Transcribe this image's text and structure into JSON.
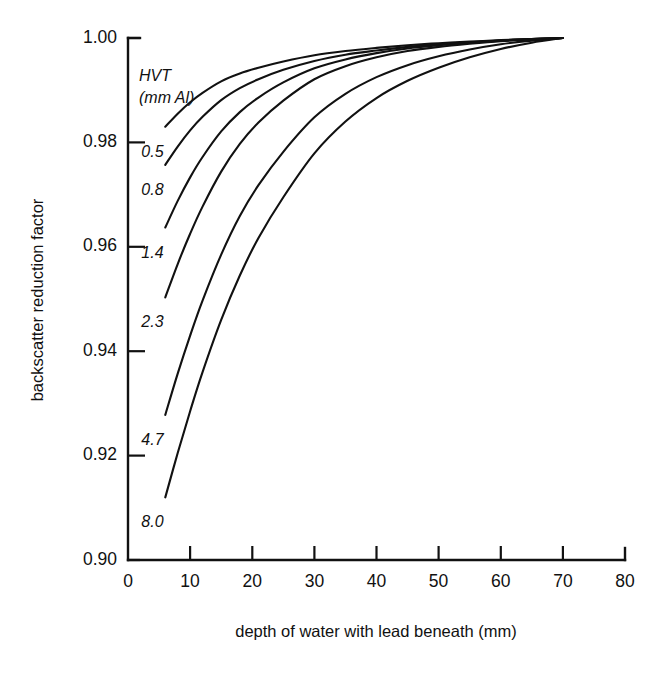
{
  "chart_data": {
    "type": "line",
    "title": "",
    "xlabel": "depth of water with lead beneath (mm)",
    "ylabel": "backscatter reduction factor",
    "xlim": [
      0,
      80
    ],
    "ylim": [
      0.9,
      1.0
    ],
    "xticks": [
      0,
      10,
      20,
      30,
      40,
      50,
      60,
      70,
      80
    ],
    "xtick_labels": [
      "0",
      "10",
      "20",
      "30",
      "40",
      "50",
      "60",
      "70",
      "80"
    ],
    "yticks": [
      0.9,
      0.92,
      0.94,
      0.96,
      0.98,
      1.0
    ],
    "ytick_labels": [
      "0.90",
      "0.92",
      "0.94",
      "0.96",
      "0.98",
      "1.00"
    ],
    "grid": false,
    "legend_position": "inside-upper-left (inline curve labels)",
    "legend_title": "HVT",
    "legend_units": "(mm Al)",
    "series": [
      {
        "name": "0.5",
        "label": "0.5",
        "x": [
          6,
          8,
          10,
          12,
          15,
          18,
          21,
          25,
          30,
          35,
          40,
          45,
          50,
          55,
          60,
          65,
          70
        ],
        "values": [
          0.983,
          0.9855,
          0.9877,
          0.9895,
          0.9917,
          0.9932,
          0.9943,
          0.9955,
          0.9967,
          0.9975,
          0.9981,
          0.9986,
          0.999,
          0.9993,
          0.9996,
          0.9998,
          1.0
        ]
      },
      {
        "name": "0.8",
        "label": "0.8",
        "x": [
          6,
          8,
          10,
          12,
          15,
          18,
          21,
          25,
          30,
          35,
          40,
          45,
          50,
          55,
          60,
          65,
          70
        ],
        "values": [
          0.9757,
          0.9792,
          0.9823,
          0.9849,
          0.9881,
          0.9904,
          0.9921,
          0.9939,
          0.9956,
          0.9968,
          0.9976,
          0.9983,
          0.9988,
          0.9992,
          0.9995,
          0.9998,
          1.0
        ]
      },
      {
        "name": "1.4",
        "label": "1.4",
        "x": [
          6,
          8,
          10,
          12,
          15,
          18,
          21,
          25,
          30,
          35,
          40,
          45,
          50,
          55,
          60,
          65,
          70
        ],
        "values": [
          0.9637,
          0.9688,
          0.9733,
          0.9772,
          0.9821,
          0.9858,
          0.9886,
          0.9915,
          0.9942,
          0.9959,
          0.9971,
          0.998,
          0.9986,
          0.9991,
          0.9995,
          0.9998,
          1.0
        ]
      },
      {
        "name": "2.3",
        "label": "2.3",
        "x": [
          6,
          8,
          10,
          12,
          15,
          18,
          21,
          25,
          30,
          35,
          40,
          45,
          50,
          55,
          60,
          65,
          70
        ],
        "values": [
          0.9503,
          0.9567,
          0.9625,
          0.9677,
          0.9744,
          0.9797,
          0.9838,
          0.988,
          0.9921,
          0.9946,
          0.9963,
          0.9975,
          0.9983,
          0.9989,
          0.9994,
          0.9997,
          1.0
        ]
      },
      {
        "name": "4.7",
        "label": "4.7",
        "x": [
          6,
          8,
          10,
          12,
          15,
          18,
          21,
          25,
          30,
          35,
          40,
          45,
          50,
          55,
          60,
          65,
          70
        ],
        "values": [
          0.9278,
          0.9357,
          0.943,
          0.9497,
          0.9585,
          0.9659,
          0.9718,
          0.9782,
          0.9848,
          0.9893,
          0.9925,
          0.9948,
          0.9965,
          0.9978,
          0.9988,
          0.9995,
          1.0
        ]
      },
      {
        "name": "8.0",
        "label": "8.0",
        "x": [
          6,
          8,
          10,
          12,
          15,
          18,
          21,
          25,
          30,
          35,
          40,
          45,
          50,
          55,
          60,
          65,
          70
        ],
        "values": [
          0.912,
          0.9205,
          0.9285,
          0.936,
          0.946,
          0.9545,
          0.9617,
          0.9695,
          0.9779,
          0.984,
          0.9885,
          0.9918,
          0.9943,
          0.9963,
          0.9979,
          0.9991,
          1.0
        ]
      }
    ]
  }
}
